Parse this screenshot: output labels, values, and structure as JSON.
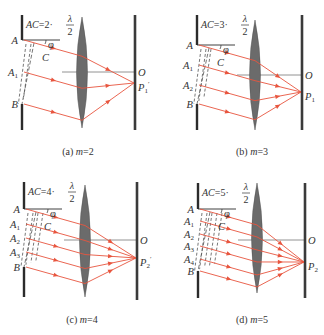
{
  "figure": {
    "colors": {
      "ray": "#e8553e",
      "slit": "#2b2b2b",
      "screen": "#3a3a3a",
      "lens": "#6b6b6b",
      "axis": "#777777",
      "text": "#333333",
      "dash": "#555555"
    },
    "panels": [
      {
        "id": "a",
        "caption": "(a) m=2",
        "caption_prefix": "(a) ",
        "caption_m": "m",
        "caption_val": "=2",
        "equation": {
          "lhs": "AC",
          "eq": "=2·",
          "num": "λ",
          "den": "2"
        },
        "phi_label": "φ",
        "c_label": "C",
        "o_label": "O",
        "p_label": "P",
        "p_sub": "1",
        "p_prime": "′",
        "points": [
          {
            "name": "A",
            "sub": "",
            "y": 40
          },
          {
            "name": "A",
            "sub": "1",
            "y": 72
          },
          {
            "name": "B",
            "sub": "",
            "y": 104
          }
        ],
        "geom": {
          "slitX": 22,
          "slitTop": 15,
          "slitBot": 130,
          "lensX": 82,
          "lensTop": 17,
          "lensBot": 128,
          "screenX": 135,
          "screenTop": 15,
          "screenBot": 130,
          "oY": 72,
          "pY": 83,
          "axisY": 72,
          "capX": 78,
          "capY": 155,
          "zones": 2
        }
      },
      {
        "id": "b",
        "caption": "(b) m=3",
        "caption_prefix": "(b) ",
        "caption_m": "m",
        "caption_val": "=3",
        "equation": {
          "lhs": "AC",
          "eq": "=3·",
          "num": "λ",
          "den": "2"
        },
        "phi_label": "φ",
        "c_label": "C",
        "o_label": "O",
        "p_label": "P",
        "p_sub": "1",
        "p_prime": "",
        "points": [
          {
            "name": "A",
            "sub": "",
            "y": 45
          },
          {
            "name": "A",
            "sub": "1",
            "y": 65
          },
          {
            "name": "A",
            "sub": "2",
            "y": 85
          },
          {
            "name": "B",
            "sub": "",
            "y": 104
          }
        ],
        "geom": {
          "slitX": 197,
          "slitTop": 15,
          "slitBot": 130,
          "lensX": 255,
          "lensTop": 20,
          "lensBot": 130,
          "screenX": 302,
          "screenTop": 15,
          "screenBot": 130,
          "oY": 75,
          "pY": 92,
          "axisY": 75,
          "capX": 252,
          "capY": 155,
          "zones": 3
        }
      },
      {
        "id": "c",
        "caption": "(c) m=4",
        "caption_prefix": "(c) ",
        "caption_m": "m",
        "caption_val": "=4",
        "equation": {
          "lhs": "AC",
          "eq": "=4·",
          "num": "λ",
          "den": "2"
        },
        "phi_label": "φ",
        "c_label": "C",
        "o_label": "O",
        "p_label": "P",
        "p_sub": "2",
        "p_prime": "′",
        "points": [
          {
            "name": "A",
            "sub": "",
            "y": 209
          },
          {
            "name": "A",
            "sub": "1",
            "y": 224
          },
          {
            "name": "A",
            "sub": "2",
            "y": 238
          },
          {
            "name": "A",
            "sub": "3",
            "y": 252
          },
          {
            "name": "B",
            "sub": "",
            "y": 267
          }
        ],
        "geom": {
          "slitX": 24,
          "slitTop": 182,
          "slitBot": 297,
          "lensX": 85,
          "lensTop": 185,
          "lensBot": 297,
          "screenX": 137,
          "screenTop": 182,
          "screenBot": 300,
          "oY": 240,
          "pY": 258,
          "axisY": 240,
          "capX": 82,
          "capY": 323,
          "zones": 4
        }
      },
      {
        "id": "d",
        "caption": "(d) m=5",
        "caption_prefix": "(d) ",
        "caption_m": "m",
        "caption_val": "=5",
        "equation": {
          "lhs": "AC",
          "eq": "=5·",
          "num": "λ",
          "den": "2"
        },
        "phi_label": "φ",
        "c_label": "C",
        "o_label": "O",
        "p_label": "P",
        "p_sub": "2",
        "p_prime": "",
        "points": [
          {
            "name": "A",
            "sub": "",
            "y": 209
          },
          {
            "name": "A",
            "sub": "1",
            "y": 221
          },
          {
            "name": "A",
            "sub": "2",
            "y": 234
          },
          {
            "name": "A",
            "sub": "3",
            "y": 246
          },
          {
            "name": "A",
            "sub": "4",
            "y": 259
          },
          {
            "name": "B",
            "sub": "",
            "y": 271
          }
        ],
        "geom": {
          "slitX": 198,
          "slitTop": 183,
          "slitBot": 298,
          "lensX": 257,
          "lensTop": 183,
          "lensBot": 293,
          "screenX": 305,
          "screenTop": 183,
          "screenBot": 298,
          "oY": 240,
          "pY": 262,
          "axisY": 240,
          "capX": 252,
          "capY": 323,
          "zones": 5
        }
      }
    ]
  }
}
